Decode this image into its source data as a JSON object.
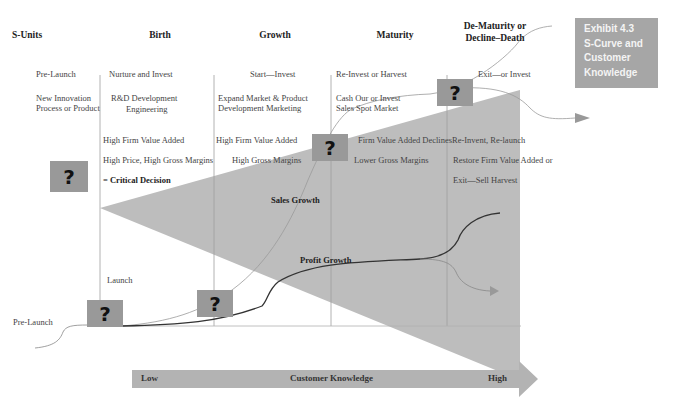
{
  "exhibit": {
    "lines": [
      "Exhibit 4.3",
      "S-Curve and",
      "Customer",
      "Knowledge"
    ],
    "background": "#a6a6a6"
  },
  "columns": {
    "headers": [
      "S-Units",
      "Birth",
      "Growth",
      "Maturity",
      "De-Maturity or",
      "Decline–Death"
    ]
  },
  "s_units": {
    "pre_launch": "Pre-Launch",
    "innovation_line1": "New Innovation",
    "innovation_line2": "Process or Product"
  },
  "birth": {
    "strategy": "Nurture and Invest",
    "focus_line1": "R&D Development",
    "focus_line2": "Engineering",
    "value": "High Firm Value Added",
    "margins": "High Price, High Gross Margins",
    "decision": "= Critical Decision",
    "launch": "Launch"
  },
  "growth": {
    "strategy": "Start—Invest",
    "focus_line1": "Expand Market & Product",
    "focus_line2": "Development Marketing",
    "value": "High  Firm Value Added",
    "margins": "High Gross Margins"
  },
  "maturity": {
    "strategy": "Re-Invest or Harvest",
    "focus_line1": "Cash Our  or Invest",
    "focus_line2": "Sales Spot Market",
    "value": "Firm Value Added Declines",
    "margins": "Lower Gross Margins"
  },
  "decline": {
    "strategy": "Exit—or Invest",
    "line1": "Re-Invent, Re-launch",
    "line2": "Restore Firm Value Added or",
    "line3": "Exit—Sell Harvest"
  },
  "curves": {
    "sales_label": "Sales Growth",
    "profit_label": "Profit Growth",
    "pre_launch_label": "Pre-Launch"
  },
  "decision_icon": "?",
  "axis": {
    "low": "Low",
    "title": "Customer Knowledge",
    "high": "High"
  },
  "colors": {
    "wedge": "#bdbdbd",
    "box": "#999999",
    "arrow": "#b3b3b3",
    "divider": "#a0a0a0"
  }
}
